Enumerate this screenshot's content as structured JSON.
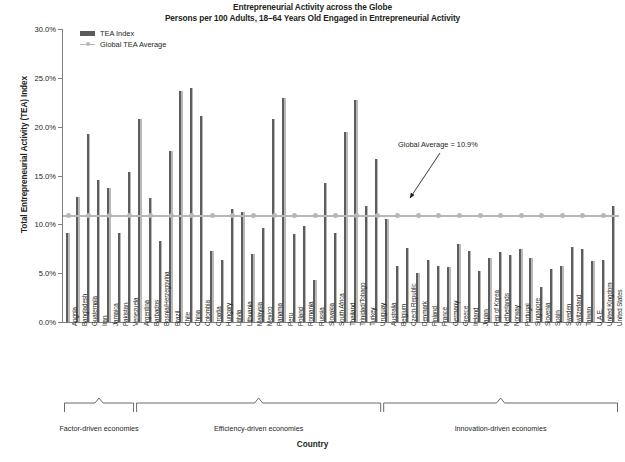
{
  "chart_data": {
    "type": "bar",
    "title": "Entrepreneurial Activity across the Globe",
    "subtitle": "Persons per 100 Adults, 18–64 Years Old Engaged in Entrepreneurial Activity",
    "xlabel": "Country",
    "ylabel": "Total Entrepreneurial Activity (TEA) Index",
    "ylim": [
      0,
      30
    ],
    "ytick_labels": [
      "0.0%",
      "5.0%",
      "10.0%",
      "15.0%",
      "20.0%",
      "25.0%",
      "30.0%"
    ],
    "ytick_values": [
      0,
      5,
      10,
      15,
      20,
      25,
      30
    ],
    "grid": false,
    "legend_position": "top-left",
    "legend": [
      "TEA Index",
      "Global TEA Average"
    ],
    "annotation": "Global Average = 10.9%",
    "global_average": 10.9,
    "series": [
      {
        "name": "TEA Index",
        "color": "#5d5d5d"
      },
      {
        "name": "Global TEA Average",
        "color": "#b7b7b7"
      }
    ],
    "categories": [
      "Angola",
      "Bangladesh",
      "Guatemala",
      "Iran",
      "Jamaica",
      "Pakistan",
      "Venezuela",
      "Argentina",
      "Barbados",
      "Bosnia/Herzegovina",
      "Brazil",
      "Chile",
      "China",
      "Colombia",
      "Croatia",
      "Hungary",
      "Latvia",
      "Lithuania",
      "Malaysia",
      "Mexico",
      "Panama",
      "Peru",
      "Poland",
      "Romania",
      "Russia",
      "Slovakia",
      "South Africa",
      "Thailand",
      "Trinidad/Tobago",
      "Turkey",
      "Uruguay",
      "Australia",
      "Belgium",
      "Czech Republic",
      "Denmark",
      "Finland",
      "France",
      "Germany",
      "Greece",
      "Ireland",
      "Japan",
      "Rep of Korea",
      "Netherlands",
      "Norway",
      "Portugal",
      "Singapore",
      "Slovenia",
      "Spain",
      "Sweden",
      "Switzerland",
      "Taiwan",
      "U.A.E.",
      "United Kingdom",
      "United States"
    ],
    "values": [
      9.1,
      12.8,
      19.3,
      14.5,
      13.7,
      9.1,
      15.4,
      20.8,
      12.7,
      8.3,
      17.5,
      23.7,
      24.0,
      21.1,
      7.3,
      6.3,
      11.6,
      11.3,
      7.0,
      9.6,
      20.8,
      22.9,
      9.0,
      9.8,
      4.3,
      14.2,
      9.1,
      19.5,
      22.7,
      11.9,
      16.7,
      10.5,
      5.7,
      7.6,
      5.0,
      6.3,
      5.7,
      5.6,
      8.0,
      7.3,
      5.2,
      6.6,
      7.2,
      6.9,
      7.5,
      6.6,
      3.6,
      5.4,
      5.7,
      7.7,
      7.5,
      6.2,
      6.4,
      11.9
    ],
    "groups": [
      {
        "label": "Factor-driven economies",
        "start": 0,
        "end": 7
      },
      {
        "label": "Efficiency-driven economies",
        "start": 7,
        "end": 31
      },
      {
        "label": "Innovation-driven economies",
        "start": 31,
        "end": 54
      }
    ]
  }
}
